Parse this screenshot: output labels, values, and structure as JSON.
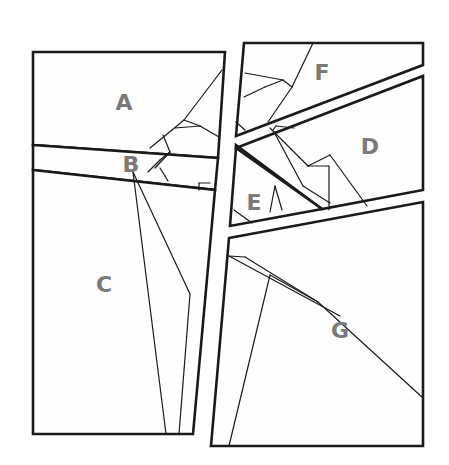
{
  "canvas": {
    "width": 449,
    "height": 465,
    "background": "#ffffff"
  },
  "colors": {
    "stroke": "#1a1a1a",
    "label": "#7a7a7a",
    "fill": "#fefefe"
  },
  "pieces": [
    {
      "id": "A",
      "label": "A",
      "label_pos": [
        124,
        102
      ],
      "polygon": [
        [
          33,
          52
        ],
        [
          225,
          52
        ],
        [
          218,
          158
        ],
        [
          33,
          145
        ]
      ]
    },
    {
      "id": "B",
      "label": "B",
      "label_pos": [
        131,
        164
      ],
      "polygon": [
        [
          33,
          145
        ],
        [
          218,
          158
        ],
        [
          215,
          190
        ],
        [
          33,
          170
        ]
      ]
    },
    {
      "id": "C",
      "label": "C",
      "label_pos": [
        104,
        284
      ],
      "polygon": [
        [
          33,
          170
        ],
        [
          215,
          190
        ],
        [
          193,
          434
        ],
        [
          33,
          434
        ]
      ]
    },
    {
      "id": "F",
      "label": "F",
      "label_pos": [
        322,
        72
      ],
      "polygon": [
        [
          244,
          43
        ],
        [
          423,
          43
        ],
        [
          423,
          65
        ],
        [
          236,
          136
        ]
      ]
    },
    {
      "id": "D",
      "label": "D",
      "label_pos": [
        370,
        146
      ],
      "polygon": [
        [
          236,
          148
        ],
        [
          423,
          76
        ],
        [
          423,
          190
        ],
        [
          322,
          209
        ],
        [
          236,
          145
        ]
      ]
    },
    {
      "id": "E",
      "label": "E",
      "label_pos": [
        254,
        202
      ],
      "polygon": [
        [
          236,
          148
        ],
        [
          322,
          209
        ],
        [
          230,
          226
        ]
      ]
    },
    {
      "id": "G",
      "label": "G",
      "label_pos": [
        340,
        330
      ],
      "polygon": [
        [
          229,
          238
        ],
        [
          423,
          202
        ],
        [
          423,
          446
        ],
        [
          211,
          446
        ]
      ]
    }
  ],
  "creases": [
    [
      [
        222,
        70
      ],
      [
        184,
        120
      ]
    ],
    [
      [
        184,
        120
      ],
      [
        172,
        130
      ]
    ],
    [
      [
        172,
        130
      ],
      [
        150,
        148
      ]
    ],
    [
      [
        184,
        120
      ],
      [
        200,
        126
      ]
    ],
    [
      [
        200,
        126
      ],
      [
        219,
        137
      ]
    ],
    [
      [
        175,
        128
      ],
      [
        200,
        126
      ]
    ],
    [
      [
        163,
        135
      ],
      [
        170,
        152
      ]
    ],
    [
      [
        170,
        152
      ],
      [
        160,
        160
      ]
    ],
    [
      [
        160,
        160
      ],
      [
        148,
        172
      ]
    ],
    [
      [
        170,
        152
      ],
      [
        155,
        168
      ]
    ],
    [
      [
        160,
        168
      ],
      [
        165,
        176
      ]
    ],
    [
      [
        165,
        176
      ],
      [
        168,
        181
      ]
    ],
    [
      [
        133,
        172
      ],
      [
        166,
        434
      ]
    ],
    [
      [
        133,
        172
      ],
      [
        190,
        294
      ]
    ],
    [
      [
        190,
        294
      ],
      [
        179,
        434
      ]
    ],
    [
      [
        199,
        183
      ],
      [
        210,
        183
      ]
    ],
    [
      [
        199,
        183
      ],
      [
        199,
        190
      ]
    ],
    [
      [
        313,
        43
      ],
      [
        292,
        87
      ]
    ],
    [
      [
        292,
        87
      ],
      [
        268,
        122
      ]
    ],
    [
      [
        292,
        87
      ],
      [
        283,
        80
      ]
    ],
    [
      [
        283,
        80
      ],
      [
        245,
        73
      ]
    ],
    [
      [
        283,
        80
      ],
      [
        265,
        87
      ]
    ],
    [
      [
        265,
        87
      ],
      [
        244,
        97
      ]
    ],
    [
      [
        236,
        122
      ],
      [
        245,
        130
      ]
    ],
    [
      [
        270,
        128
      ],
      [
        274,
        132
      ]
    ],
    [
      [
        274,
        132
      ],
      [
        303,
        186
      ]
    ],
    [
      [
        303,
        186
      ],
      [
        330,
        203
      ]
    ],
    [
      [
        274,
        132
      ],
      [
        308,
        166
      ]
    ],
    [
      [
        308,
        166
      ],
      [
        330,
        155
      ]
    ],
    [
      [
        308,
        166
      ],
      [
        329,
        166
      ]
    ],
    [
      [
        329,
        166
      ],
      [
        329,
        210
      ]
    ],
    [
      [
        294,
        128
      ],
      [
        276,
        126
      ]
    ],
    [
      [
        276,
        126
      ],
      [
        273,
        130
      ]
    ],
    [
      [
        330,
        155
      ],
      [
        367,
        206
      ]
    ],
    [
      [
        275,
        186
      ],
      [
        282,
        210
      ]
    ],
    [
      [
        275,
        186
      ],
      [
        270,
        212
      ]
    ],
    [
      [
        234,
        210
      ],
      [
        252,
        223
      ]
    ],
    [
      [
        229,
        256
      ],
      [
        245,
        257
      ]
    ],
    [
      [
        245,
        257
      ],
      [
        318,
        302
      ]
    ],
    [
      [
        318,
        302
      ],
      [
        423,
        398
      ]
    ],
    [
      [
        229,
        256
      ],
      [
        340,
        316
      ]
    ],
    [
      [
        270,
        275
      ],
      [
        229,
        446
      ]
    ],
    [
      [
        270,
        275
      ],
      [
        318,
        302
      ]
    ]
  ]
}
